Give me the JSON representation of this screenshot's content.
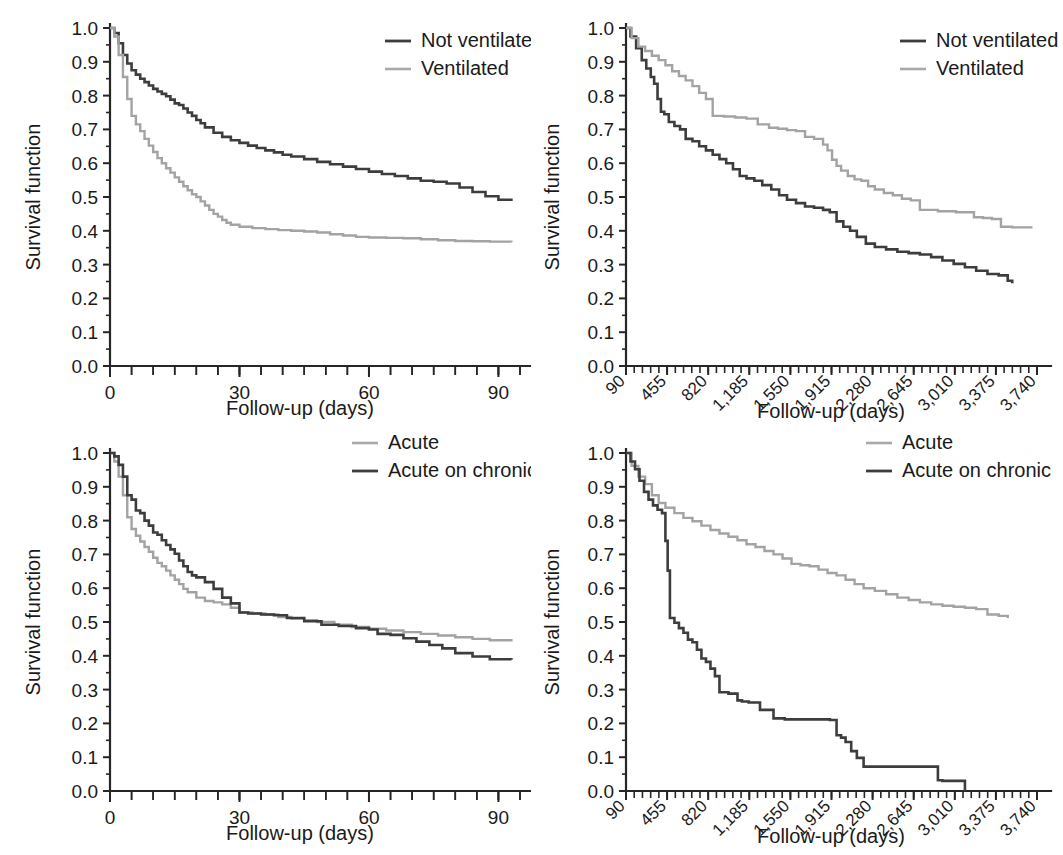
{
  "figure": {
    "title": "",
    "panel_count": 4,
    "background_color": "#ffffff",
    "colors": {
      "dark_series": "#3d3d3d",
      "light_series": "#a3a3a3",
      "axis": "#262626",
      "text": "#1a1a1a"
    }
  },
  "chart_data": [
    {
      "id": "panel-a",
      "position": "top-left",
      "type": "line",
      "title": "",
      "xlabel": "Follow-up (days)",
      "ylabel": "Survival function",
      "xlim": [
        0,
        95
      ],
      "ylim": [
        0.0,
        1.0
      ],
      "xticks": [
        0,
        30,
        60,
        90
      ],
      "xtick_labels": [
        "0",
        "30",
        "60",
        "90"
      ],
      "xminor_step": 5,
      "yticks": [
        0.0,
        0.1,
        0.2,
        0.3,
        0.4,
        0.5,
        0.6,
        0.7,
        0.8,
        0.9,
        1.0
      ],
      "ytick_labels": [
        "0.0",
        "0.1",
        "0.2",
        "0.3",
        "0.4",
        "0.5",
        "0.6",
        "0.7",
        "0.8",
        "0.9",
        "1.0"
      ],
      "grid": false,
      "legend_position": "top-right",
      "legend": [
        "Not ventilated",
        "Ventilated"
      ],
      "series": [
        {
          "name": "Not ventilated",
          "color": "#3d3d3d",
          "x": [
            0,
            1,
            2,
            3,
            4,
            5,
            6,
            7,
            8,
            9,
            10,
            11,
            12,
            13,
            14,
            15,
            16,
            17,
            18,
            19,
            20,
            21,
            22,
            24,
            26,
            28,
            30,
            32,
            34,
            36,
            38,
            40,
            42,
            45,
            48,
            51,
            54,
            57,
            60,
            63,
            66,
            69,
            72,
            75,
            78,
            81,
            84,
            87,
            90,
            93
          ],
          "values": [
            1.0,
            0.985,
            0.955,
            0.92,
            0.895,
            0.875,
            0.862,
            0.85,
            0.84,
            0.83,
            0.82,
            0.812,
            0.805,
            0.798,
            0.788,
            0.777,
            0.772,
            0.762,
            0.75,
            0.74,
            0.728,
            0.718,
            0.706,
            0.69,
            0.678,
            0.668,
            0.66,
            0.652,
            0.645,
            0.638,
            0.632,
            0.625,
            0.62,
            0.612,
            0.604,
            0.597,
            0.59,
            0.583,
            0.575,
            0.568,
            0.562,
            0.555,
            0.548,
            0.545,
            0.54,
            0.528,
            0.515,
            0.502,
            0.492,
            0.488
          ]
        },
        {
          "name": "Ventilated",
          "color": "#a3a3a3",
          "x": [
            0,
            1,
            2,
            3,
            4,
            5,
            6,
            7,
            8,
            9,
            10,
            11,
            12,
            13,
            14,
            15,
            16,
            17,
            18,
            19,
            20,
            21,
            22,
            23,
            24,
            25,
            26,
            27,
            28,
            30,
            33,
            36,
            39,
            42,
            45,
            48,
            51,
            54,
            57,
            60,
            64,
            68,
            72,
            76,
            80,
            84,
            88,
            93
          ],
          "values": [
            1.0,
            0.975,
            0.92,
            0.855,
            0.79,
            0.74,
            0.715,
            0.695,
            0.672,
            0.652,
            0.633,
            0.615,
            0.6,
            0.585,
            0.572,
            0.558,
            0.545,
            0.532,
            0.52,
            0.508,
            0.5,
            0.487,
            0.475,
            0.462,
            0.45,
            0.442,
            0.432,
            0.424,
            0.418,
            0.412,
            0.408,
            0.405,
            0.402,
            0.4,
            0.398,
            0.395,
            0.39,
            0.386,
            0.382,
            0.38,
            0.379,
            0.378,
            0.375,
            0.372,
            0.37,
            0.369,
            0.368,
            0.366
          ]
        }
      ]
    },
    {
      "id": "panel-b",
      "position": "top-right",
      "type": "line",
      "title": "",
      "xlabel": "Follow-up (days)",
      "ylabel": "Survival function",
      "xlim": [
        90,
        3740
      ],
      "ylim": [
        0.0,
        1.0
      ],
      "xticks": [
        90,
        455,
        820,
        1185,
        1550,
        1915,
        2280,
        2645,
        3010,
        3375,
        3740
      ],
      "xtick_labels": [
        "90",
        "455",
        "820",
        "1,185",
        "1,550",
        "1,915",
        "2,280",
        "2,645",
        "3,010",
        "3,375",
        "3,740"
      ],
      "xtick_rotation": 45,
      "xminor_step": 73,
      "yticks": [
        0.0,
        0.1,
        0.2,
        0.3,
        0.4,
        0.5,
        0.6,
        0.7,
        0.8,
        0.9,
        1.0
      ],
      "ytick_labels": [
        "0.0",
        "0.1",
        "0.2",
        "0.3",
        "0.4",
        "0.5",
        "0.6",
        "0.7",
        "0.8",
        "0.9",
        "1.0"
      ],
      "grid": false,
      "legend_position": "top-right",
      "legend": [
        "Not ventilated",
        "Ventilated"
      ],
      "series": [
        {
          "name": "Not ventilated",
          "color": "#3d3d3d",
          "x": [
            90,
            130,
            180,
            230,
            270,
            310,
            340,
            370,
            400,
            430,
            470,
            520,
            570,
            620,
            680,
            740,
            800,
            860,
            920,
            980,
            1040,
            1100,
            1160,
            1230,
            1300,
            1380,
            1450,
            1520,
            1600,
            1680,
            1760,
            1840,
            1900,
            1960,
            2020,
            2080,
            2140,
            2220,
            2300,
            2400,
            2500,
            2600,
            2700,
            2800,
            2900,
            3000,
            3100,
            3200,
            3300,
            3400,
            3480,
            3520
          ],
          "values": [
            1.0,
            0.975,
            0.94,
            0.905,
            0.88,
            0.855,
            0.835,
            0.79,
            0.752,
            0.745,
            0.722,
            0.71,
            0.7,
            0.672,
            0.665,
            0.65,
            0.638,
            0.625,
            0.612,
            0.6,
            0.582,
            0.562,
            0.555,
            0.548,
            0.535,
            0.522,
            0.505,
            0.492,
            0.482,
            0.472,
            0.468,
            0.462,
            0.455,
            0.428,
            0.412,
            0.4,
            0.382,
            0.362,
            0.352,
            0.345,
            0.338,
            0.334,
            0.33,
            0.322,
            0.312,
            0.302,
            0.292,
            0.282,
            0.272,
            0.268,
            0.252,
            0.245
          ]
        },
        {
          "name": "Ventilated",
          "color": "#a3a3a3",
          "x": [
            90,
            140,
            200,
            260,
            320,
            380,
            440,
            500,
            560,
            620,
            680,
            740,
            800,
            860,
            960,
            1060,
            1160,
            1260,
            1360,
            1440,
            1520,
            1600,
            1680,
            1760,
            1840,
            1880,
            1920,
            1960,
            2000,
            2060,
            2120,
            2180,
            2240,
            2300,
            2380,
            2460,
            2540,
            2620,
            2700,
            2860,
            3020,
            3180,
            3260,
            3340,
            3420,
            3520,
            3620,
            3700
          ],
          "values": [
            1.0,
            0.97,
            0.945,
            0.932,
            0.918,
            0.905,
            0.89,
            0.872,
            0.858,
            0.845,
            0.828,
            0.808,
            0.79,
            0.74,
            0.738,
            0.735,
            0.732,
            0.715,
            0.705,
            0.702,
            0.698,
            0.695,
            0.678,
            0.672,
            0.655,
            0.638,
            0.61,
            0.592,
            0.578,
            0.562,
            0.552,
            0.548,
            0.532,
            0.522,
            0.512,
            0.505,
            0.495,
            0.49,
            0.462,
            0.458,
            0.455,
            0.44,
            0.438,
            0.435,
            0.412,
            0.41,
            0.41,
            0.41
          ]
        }
      ]
    },
    {
      "id": "panel-c",
      "position": "bottom-left",
      "type": "line",
      "title": "",
      "xlabel": "Follow-up (days)",
      "ylabel": "Survival function",
      "xlim": [
        0,
        95
      ],
      "ylim": [
        0.0,
        1.0
      ],
      "xticks": [
        0,
        30,
        60,
        90
      ],
      "xtick_labels": [
        "0",
        "30",
        "60",
        "90"
      ],
      "xminor_step": 5,
      "yticks": [
        0.0,
        0.1,
        0.2,
        0.3,
        0.4,
        0.5,
        0.6,
        0.7,
        0.8,
        0.9,
        1.0
      ],
      "ytick_labels": [
        "0.0",
        "0.1",
        "0.2",
        "0.3",
        "0.4",
        "0.5",
        "0.6",
        "0.7",
        "0.8",
        "0.9",
        "1.0"
      ],
      "grid": false,
      "legend_position": "top-right",
      "legend": [
        "Acute",
        "Acute on chronic"
      ],
      "series": [
        {
          "name": "Acute",
          "color": "#a3a3a3",
          "x": [
            0,
            1,
            2,
            3,
            4,
            5,
            6,
            7,
            8,
            9,
            10,
            11,
            12,
            13,
            14,
            15,
            16,
            17,
            18,
            20,
            22,
            24,
            26,
            28,
            30,
            33,
            36,
            39,
            42,
            45,
            48,
            52,
            56,
            60,
            64,
            68,
            72,
            76,
            80,
            84,
            88,
            93
          ],
          "values": [
            1.0,
            0.975,
            0.93,
            0.875,
            0.81,
            0.775,
            0.755,
            0.738,
            0.722,
            0.708,
            0.69,
            0.675,
            0.665,
            0.652,
            0.638,
            0.625,
            0.612,
            0.598,
            0.588,
            0.572,
            0.562,
            0.558,
            0.552,
            0.542,
            0.528,
            0.525,
            0.522,
            0.515,
            0.51,
            0.505,
            0.5,
            0.492,
            0.485,
            0.48,
            0.475,
            0.47,
            0.465,
            0.46,
            0.455,
            0.45,
            0.446,
            0.442
          ]
        },
        {
          "name": "Acute on chronic",
          "color": "#3d3d3d",
          "x": [
            0,
            1,
            2,
            3,
            4,
            5,
            6,
            7,
            8,
            9,
            10,
            11,
            12,
            13,
            14,
            15,
            16,
            17,
            18,
            19,
            20,
            22,
            24,
            26,
            28,
            30,
            32,
            35,
            38,
            41,
            45,
            49,
            53,
            57,
            60,
            62,
            65,
            68,
            71,
            74,
            77,
            80,
            84,
            88,
            93
          ],
          "values": [
            1.0,
            0.99,
            0.965,
            0.93,
            0.875,
            0.862,
            0.83,
            0.822,
            0.8,
            0.785,
            0.765,
            0.758,
            0.742,
            0.728,
            0.715,
            0.702,
            0.682,
            0.665,
            0.648,
            0.638,
            0.632,
            0.618,
            0.598,
            0.572,
            0.555,
            0.528,
            0.525,
            0.522,
            0.52,
            0.512,
            0.502,
            0.492,
            0.488,
            0.482,
            0.478,
            0.465,
            0.462,
            0.452,
            0.442,
            0.432,
            0.422,
            0.408,
            0.398,
            0.39,
            0.388
          ]
        }
      ]
    },
    {
      "id": "panel-d",
      "position": "bottom-right",
      "type": "line",
      "title": "",
      "xlabel": "Follow-up (days)",
      "ylabel": "Survival function",
      "xlim": [
        90,
        3740
      ],
      "ylim": [
        0.0,
        1.0
      ],
      "xticks": [
        90,
        455,
        820,
        1185,
        1550,
        1915,
        2280,
        2645,
        3010,
        3375,
        3740
      ],
      "xtick_labels": [
        "90",
        "455",
        "820",
        "1,185",
        "1,550",
        "1,915",
        "2,280",
        "2,645",
        "3,010",
        "3,375",
        "3,740"
      ],
      "xtick_rotation": 45,
      "xminor_step": 73,
      "yticks": [
        0.0,
        0.1,
        0.2,
        0.3,
        0.4,
        0.5,
        0.6,
        0.7,
        0.8,
        0.9,
        1.0
      ],
      "ytick_labels": [
        "0.0",
        "0.1",
        "0.2",
        "0.3",
        "0.4",
        "0.5",
        "0.6",
        "0.7",
        "0.8",
        "0.9",
        "1.0"
      ],
      "grid": false,
      "legend_position": "top-right",
      "legend": [
        "Acute",
        "Acute on chronic"
      ],
      "series": [
        {
          "name": "Acute",
          "color": "#a3a3a3",
          "x": [
            90,
            140,
            200,
            260,
            320,
            380,
            440,
            520,
            600,
            680,
            760,
            840,
            920,
            1000,
            1080,
            1160,
            1240,
            1320,
            1400,
            1480,
            1560,
            1640,
            1720,
            1800,
            1880,
            1960,
            2040,
            2120,
            2200,
            2300,
            2400,
            2500,
            2600,
            2700,
            2800,
            2900,
            3000,
            3100,
            3200,
            3300,
            3400,
            3480
          ],
          "values": [
            1.0,
            0.962,
            0.93,
            0.908,
            0.875,
            0.852,
            0.838,
            0.822,
            0.808,
            0.798,
            0.785,
            0.772,
            0.762,
            0.752,
            0.742,
            0.73,
            0.722,
            0.71,
            0.7,
            0.688,
            0.672,
            0.668,
            0.665,
            0.655,
            0.645,
            0.638,
            0.625,
            0.612,
            0.6,
            0.592,
            0.582,
            0.572,
            0.565,
            0.558,
            0.552,
            0.548,
            0.545,
            0.542,
            0.538,
            0.522,
            0.518,
            0.512
          ]
        },
        {
          "name": "Acute on chronic",
          "color": "#3d3d3d",
          "x": [
            90,
            130,
            170,
            210,
            250,
            290,
            330,
            370,
            410,
            440,
            460,
            480,
            520,
            560,
            600,
            640,
            680,
            720,
            760,
            800,
            840,
            880,
            920,
            1000,
            1080,
            1120,
            1180,
            1280,
            1400,
            1500,
            1600,
            1700,
            1800,
            1860,
            1900,
            1960,
            2000,
            2040,
            2090,
            2140,
            2200,
            2400,
            2600,
            2800,
            2860,
            2900,
            3000,
            3100
          ],
          "values": [
            1.0,
            0.975,
            0.952,
            0.918,
            0.885,
            0.862,
            0.845,
            0.832,
            0.822,
            0.74,
            0.652,
            0.512,
            0.498,
            0.482,
            0.468,
            0.448,
            0.44,
            0.418,
            0.392,
            0.382,
            0.362,
            0.34,
            0.292,
            0.288,
            0.268,
            0.265,
            0.262,
            0.24,
            0.215,
            0.212,
            0.212,
            0.212,
            0.212,
            0.212,
            0.21,
            0.165,
            0.158,
            0.145,
            0.118,
            0.098,
            0.072,
            0.072,
            0.072,
            0.072,
            0.032,
            0.03,
            0.03,
            0.0
          ]
        }
      ]
    }
  ]
}
